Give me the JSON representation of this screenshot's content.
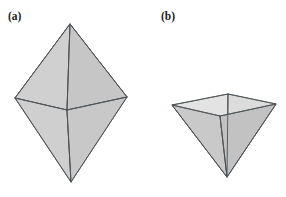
{
  "figure": {
    "background_color": "#ffffff",
    "panels": [
      {
        "id": "panel-a",
        "label": "(a)",
        "label_x": 8,
        "label_y": 11,
        "shape_name": "square-bipyramid",
        "description": "Square bipyramid (octahedron-like solid) shown in shaded 3D perspective",
        "vertices": {
          "top_apex": [
            70,
            24
          ],
          "left": [
            15,
            98
          ],
          "right": [
            127,
            97
          ],
          "front": [
            67,
            110
          ],
          "back": [
            73,
            86
          ],
          "bottom_apex": [
            71,
            182
          ]
        },
        "faces": [
          {
            "name": "upper-back-left",
            "points": "70,24 15,98 73,86",
            "fill": "#cccccc",
            "stroke": "#4d5256"
          },
          {
            "name": "upper-back-right",
            "points": "70,24 73,86 127,97",
            "fill": "#c9c9c9",
            "stroke": "#4d5256"
          },
          {
            "name": "upper-front-left",
            "points": "70,24 15,98 67,110",
            "fill": "#d0d0d0",
            "stroke": "#4d5256"
          },
          {
            "name": "upper-front-right",
            "points": "70,24 67,110 127,97",
            "fill": "#c6c6c6",
            "stroke": "#4d5256"
          },
          {
            "name": "lower-front-left",
            "points": "71,182 15,98 67,110",
            "fill": "#cfcfcf",
            "stroke": "#4d5256"
          },
          {
            "name": "lower-front-right",
            "points": "71,182 67,110 127,97",
            "fill": "#c8c8c8",
            "stroke": "#4d5256"
          }
        ],
        "edges": [
          {
            "name": "apex-to-left",
            "d": "M70,24 L15,98"
          },
          {
            "name": "apex-to-right",
            "d": "M70,24 L127,97"
          },
          {
            "name": "apex-to-front",
            "d": "M70,24 L67,110"
          },
          {
            "name": "left-to-front",
            "d": "M15,98 L67,110"
          },
          {
            "name": "front-to-right",
            "d": "M67,110 L127,97"
          },
          {
            "name": "left-to-bottom",
            "d": "M15,98 L71,182"
          },
          {
            "name": "right-to-bottom",
            "d": "M127,97 L71,182"
          },
          {
            "name": "front-to-bottom",
            "d": "M67,110 L71,182"
          }
        ],
        "hidden_edges": [
          {
            "name": "apex-to-back",
            "d": "M70,24 L73,86"
          },
          {
            "name": "left-to-back",
            "d": "M15,98 L73,86"
          },
          {
            "name": "back-to-right",
            "d": "M73,86 L127,97"
          },
          {
            "name": "back-to-bottom",
            "d": "M73,86 L71,182"
          }
        ]
      },
      {
        "id": "panel-b",
        "label": "(b)",
        "label_x": 161,
        "label_y": 11,
        "shape_name": "inverted-open-square-pyramid",
        "description": "Inverted square pyramid with open top rim, shown in shaded 3D perspective",
        "vertices": {
          "rim_left": [
            172,
            105
          ],
          "rim_front": [
            220,
            116
          ],
          "rim_right": [
            276,
            104
          ],
          "rim_back": [
            228,
            94
          ],
          "bottom_apex": [
            227,
            177
          ]
        },
        "faces": [
          {
            "name": "outer-front-left",
            "points": "172,105 220,116 227,177",
            "fill": "#c9c9c9",
            "stroke": "#4d5256"
          },
          {
            "name": "outer-front-right",
            "points": "220,116 276,104 227,177",
            "fill": "#c2c2c2",
            "stroke": "#4d5256"
          },
          {
            "name": "inner-back-left",
            "points": "172,105 228,94 227,177",
            "fill": "#e3e3e3",
            "stroke": "#5a5f63"
          },
          {
            "name": "inner-back-right",
            "points": "228,94 276,104 227,177",
            "fill": "#dcdcdc",
            "stroke": "#5a5f63"
          }
        ],
        "rim": {
          "name": "open-top-rim",
          "points": "172,105 228,94 276,104 220,116",
          "stroke": "#4d5256"
        },
        "edges": [
          {
            "name": "rim-left-to-apex",
            "d": "M172,105 L227,177"
          },
          {
            "name": "rim-front-to-apex",
            "d": "M220,116 L227,177"
          },
          {
            "name": "rim-right-to-apex",
            "d": "M276,104 L227,177"
          },
          {
            "name": "rim-back-to-apex",
            "d": "M228,94 L227,177"
          }
        ]
      }
    ],
    "style": {
      "fill_color": "#cccccc",
      "interior_fill_color": "#e0e0e0",
      "edge_color": "#4d5256",
      "label_color": "#1b1b1b",
      "edge_width": 0.9
    }
  }
}
